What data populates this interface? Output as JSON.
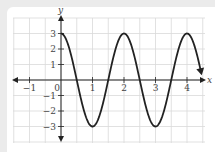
{
  "chart_data": {
    "type": "line",
    "title": "",
    "xlabel": "x",
    "ylabel": "y",
    "xlim": [
      -1.5,
      4.5
    ],
    "ylim": [
      -4,
      4
    ],
    "grid": true,
    "x_ticks": [
      "-1",
      "0",
      "1",
      "2",
      "3",
      "4"
    ],
    "y_ticks": [
      "3",
      "2",
      "1",
      "-1",
      "-2",
      "-3"
    ],
    "function": "y = 3cos(pi x)",
    "series": [
      {
        "name": "curve",
        "x": [
          0,
          0.5,
          1,
          1.5,
          2,
          2.5,
          3,
          3.5,
          4,
          4.5
        ],
        "y": [
          3,
          0,
          -3,
          0,
          3,
          0,
          -3,
          0,
          3,
          0
        ]
      }
    ],
    "colors": {
      "curve": "#222222",
      "axis": "#222222",
      "grid": "#d9d9d9"
    }
  }
}
